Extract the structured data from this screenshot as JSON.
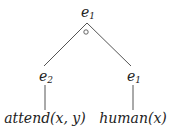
{
  "diagram": {
    "type": "tree",
    "root": {
      "base": "e",
      "sub": "1",
      "operator": "∘"
    },
    "children": [
      {
        "base": "e",
        "sub": "2",
        "leaf": "attend(x, y)"
      },
      {
        "base": "e",
        "sub": "1",
        "leaf": "human(x)"
      }
    ]
  },
  "colors": {
    "line": "#555555",
    "text": "#222222"
  }
}
